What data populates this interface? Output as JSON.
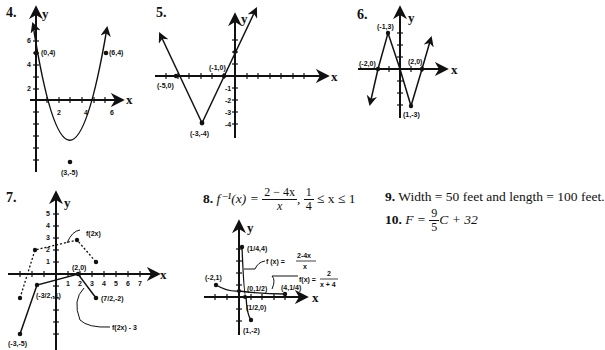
{
  "problems": {
    "p4": {
      "number": "4.",
      "axis_y": "y",
      "axis_x": "x",
      "points": [
        "(0,4)",
        "(6,4)",
        "(3,-5)"
      ],
      "y_ticks": [
        "6",
        "4",
        "2"
      ],
      "x_ticks": [
        "2",
        "4",
        "6"
      ]
    },
    "p5": {
      "number": "5.",
      "axis_y": "y",
      "axis_x": "x",
      "points": [
        "(-5,0)",
        "(-1,0)",
        "(-3,-4)"
      ],
      "y_ticks": [
        "-1",
        "-2",
        "-3",
        "-4"
      ]
    },
    "p6": {
      "number": "6.",
      "axis_y": "y",
      "axis_x": "x",
      "points": [
        "(-1,3)",
        "(-2,0)",
        "(2,0)",
        "(1,-3)"
      ]
    },
    "p7": {
      "number": "7.",
      "axis_y": "y",
      "axis_x": "x",
      "points": [
        "(2,0)",
        "(-3/2,-1)",
        "(7/2,-2)",
        "(-3,-5)"
      ],
      "labels": [
        "f(2x)",
        "f(2x) - 3"
      ],
      "y_ticks": [
        "5",
        "4",
        "3",
        "2",
        "1"
      ],
      "x_ticks": [
        "1",
        "2",
        "3",
        "4",
        "5",
        "6",
        "7"
      ]
    },
    "p8": {
      "number": "8.",
      "lhs": "f⁻¹(x) =",
      "num": "2 − 4x",
      "den": "x",
      "domain_num": "1",
      "domain_den": "4",
      "domain_rest": "≤ x ≤ 1",
      "axis_y": "y",
      "axis_x": "x",
      "points": [
        "(1/4,4)",
        "(-2,1)",
        "(0,1/2)",
        "(4,1/4)",
        "(1/2,0)",
        "(1,-2)"
      ],
      "label1": "f (x) =",
      "label1_num": "2-4x",
      "label1_den": "x",
      "label2": "f(x) =",
      "label2_num": "2",
      "label2_den": "x + 4"
    },
    "p9": {
      "number": "9.",
      "text": "Width = 50 feet and length = 100 feet."
    },
    "p10": {
      "number": "10.",
      "lhs": "F =",
      "num": "9",
      "den": "5",
      "rest": "C + 32"
    }
  }
}
